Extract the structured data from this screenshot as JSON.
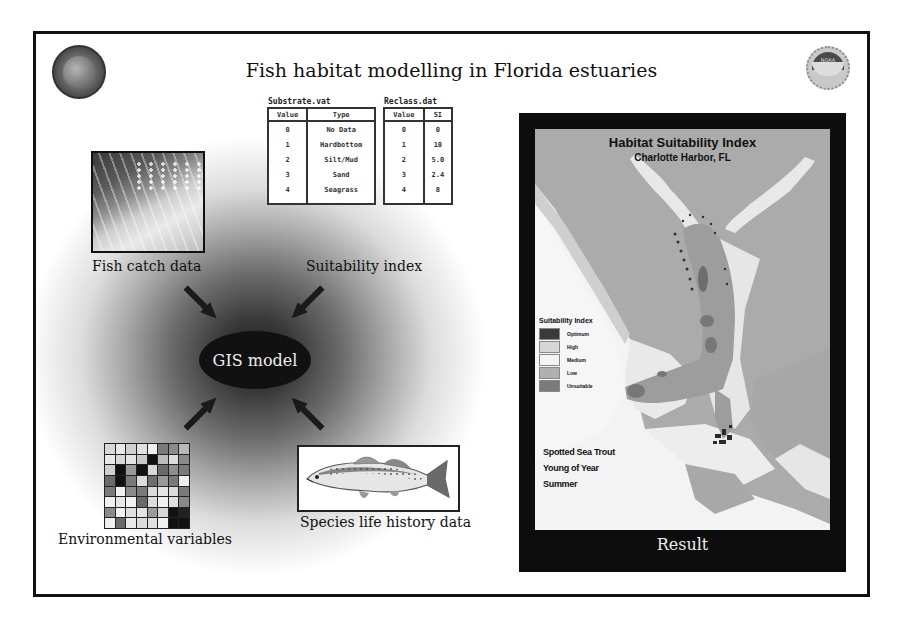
{
  "title": "Fish habitat modelling in Florida estuaries",
  "logos": {
    "left": "state-seal-icon",
    "right": "noaa-logo-icon",
    "right_text": "NOAA"
  },
  "inputs": {
    "fish_catch": {
      "label": "Fish catch data",
      "image": "fish-catch-photo"
    },
    "suitability": {
      "label": "Suitability index"
    },
    "environmental": {
      "label": "Environmental variables",
      "image": "raster-grid"
    },
    "species": {
      "label": "Species life history data",
      "image": "spotted-seatrout-drawing"
    }
  },
  "center": {
    "label": "GIS model"
  },
  "substrate_table": {
    "filename": "Substrate.vat",
    "headers": [
      "Value",
      "Type"
    ],
    "rows": [
      [
        "0",
        "No Data"
      ],
      [
        "1",
        "Hardbottom"
      ],
      [
        "2",
        "Silt/Mud"
      ],
      [
        "3",
        "Sand"
      ],
      [
        "4",
        "Seagrass"
      ]
    ]
  },
  "reclass_table": {
    "filename": "Reclass.dat",
    "headers": [
      "Value",
      "SI"
    ],
    "rows": [
      [
        "0",
        "0"
      ],
      [
        "1",
        "10"
      ],
      [
        "2",
        "5.0"
      ],
      [
        "3",
        "2.4"
      ],
      [
        "4",
        "8"
      ]
    ]
  },
  "map": {
    "title": "Habitat Suitability Index",
    "subtitle": "Charlotte Harbor, FL",
    "legend_title": "Suitability Index",
    "legend": [
      {
        "label": "Optimum",
        "color": "#3a3a3a"
      },
      {
        "label": "High",
        "color": "#d6d6d6"
      },
      {
        "label": "Medium",
        "color": "#f4f4f4"
      },
      {
        "label": "Low",
        "color": "#b0b0b0"
      },
      {
        "label": "Unsuitable",
        "color": "#7a7a7a"
      }
    ],
    "species": "Spotted Sea Trout",
    "life_stage": "Young of Year",
    "season": "Summer",
    "caption": "Result"
  },
  "grid_cells": [
    "#d8d8d8",
    "#e8e8e8",
    "#d0d0d0",
    "#e0e0e0",
    "#efefef",
    "#7a7a7a",
    "#8a8a8a",
    "#b8b8b8",
    "#e8e8e8",
    "#d8d8d8",
    "#e4e4e4",
    "#c8c8c8",
    "#111111",
    "#bcbcbc",
    "#dcdcdc",
    "#8a8a8a",
    "#cfcfcf",
    "#111111",
    "#9a9a9a",
    "#111111",
    "#d8d8d8",
    "#6a6a6a",
    "#8e8e8e",
    "#7a7a7a",
    "#6a6a6a",
    "#111111",
    "#7a7a7a",
    "#dcdcdc",
    "#6e6e6e",
    "#9a9a9a",
    "#7a7a7a",
    "#eeeeee",
    "#7a7a7a",
    "#f0f0f0",
    "#8a8a8a",
    "#7a7a7a",
    "#dadada",
    "#e6e6e6",
    "#dcdcdc",
    "#7a7a7a",
    "#efefef",
    "#e6e6e6",
    "#f2f2f2",
    "#6a6a6a",
    "#dcdcdc",
    "#f0f0f0",
    "#dedede",
    "#8a8a8a",
    "#8a8a8a",
    "#f0f0f0",
    "#dedede",
    "#e4e4e4",
    "#9a9a9a",
    "#d6d6d6",
    "#111111",
    "#222222",
    "#f0f0f0",
    "#6a6a6a",
    "#e8e8e8",
    "#dcdcdc",
    "#e0e0e0",
    "#f0f0f0",
    "#111111",
    "#111111"
  ]
}
